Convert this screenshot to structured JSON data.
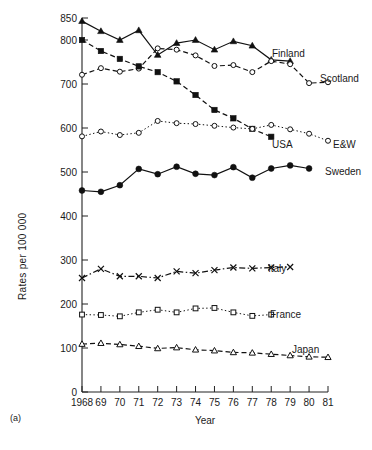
{
  "figure": {
    "panel_tag": "(a)",
    "background": "#ffffff",
    "ink_color": "#111111"
  },
  "chart_data": {
    "type": "line",
    "title": "",
    "subtitle": "",
    "xlabel": "Year",
    "ylabel": "Rates per 100 000",
    "xlim": [
      1968,
      1981
    ],
    "ylim": [
      0,
      850
    ],
    "grid": false,
    "legend_position": "inline-right-of-series",
    "x": [
      1968,
      1969,
      1970,
      1971,
      1972,
      1973,
      1974,
      1975,
      1976,
      1977,
      1978,
      1979,
      1980,
      1981
    ],
    "xtick_labels": [
      "1968",
      "69",
      "70",
      "71",
      "72",
      "73",
      "74",
      "75",
      "76",
      "77",
      "78",
      "79",
      "80",
      "81"
    ],
    "ytick_values": [
      0,
      100,
      200,
      300,
      400,
      500,
      600,
      700,
      800,
      850
    ],
    "ytick_labels": [
      "0",
      "100",
      "200",
      "300",
      "400",
      "500",
      "600",
      "700",
      "800",
      "850"
    ],
    "series": [
      {
        "name": "Finland",
        "label": "Finland",
        "marker": "filled-triangle",
        "linestyle": "solid",
        "x": [
          1968,
          1969,
          1970,
          1971,
          1972,
          1973,
          1974,
          1975,
          1976,
          1977,
          1978,
          1979
        ],
        "values": [
          843,
          820,
          800,
          822,
          766,
          793,
          800,
          778,
          797,
          787,
          755,
          752
        ]
      },
      {
        "name": "Scotland",
        "label": "Scotland",
        "marker": "open-circle",
        "linestyle": "dashed",
        "x": [
          1968,
          1969,
          1970,
          1971,
          1972,
          1973,
          1974,
          1975,
          1976,
          1977,
          1978,
          1979,
          1980,
          1981
        ],
        "values": [
          721,
          736,
          728,
          735,
          781,
          778,
          765,
          741,
          743,
          727,
          752,
          745,
          702,
          704
        ]
      },
      {
        "name": "USA",
        "label": "USA",
        "marker": "filled-square",
        "linestyle": "dashed",
        "x": [
          1968,
          1969,
          1970,
          1971,
          1972,
          1973,
          1974,
          1975,
          1976,
          1977,
          1978
        ],
        "values": [
          800,
          775,
          757,
          740,
          727,
          706,
          675,
          641,
          622,
          598,
          580
        ]
      },
      {
        "name": "E&W",
        "label": "E&W",
        "marker": "open-circle",
        "linestyle": "dotted",
        "x": [
          1968,
          1969,
          1970,
          1971,
          1972,
          1973,
          1974,
          1975,
          1976,
          1977,
          1978,
          1979,
          1980,
          1981
        ],
        "values": [
          581,
          592,
          584,
          589,
          616,
          611,
          609,
          605,
          601,
          598,
          607,
          597,
          587,
          571
        ]
      },
      {
        "name": "Sweden",
        "label": "Sweden",
        "marker": "filled-circle",
        "linestyle": "solid",
        "x": [
          1968,
          1969,
          1970,
          1971,
          1972,
          1973,
          1974,
          1975,
          1976,
          1977,
          1978,
          1979,
          1980
        ],
        "values": [
          458,
          455,
          470,
          507,
          495,
          512,
          496,
          493,
          511,
          487,
          508,
          515,
          508
        ]
      },
      {
        "name": "Italy",
        "label": "Italy",
        "marker": "x-cross",
        "linestyle": "dash-dot",
        "x": [
          1968,
          1969,
          1970,
          1971,
          1972,
          1973,
          1974,
          1975,
          1976,
          1977,
          1978,
          1979
        ],
        "values": [
          259,
          280,
          263,
          263,
          259,
          274,
          270,
          277,
          283,
          281,
          283,
          284
        ]
      },
      {
        "name": "France",
        "label": "France",
        "marker": "open-square",
        "linestyle": "dotted",
        "x": [
          1968,
          1969,
          1970,
          1971,
          1972,
          1973,
          1974,
          1975,
          1976,
          1977,
          1978
        ],
        "values": [
          176,
          175,
          172,
          181,
          187,
          181,
          190,
          191,
          181,
          173,
          176
        ]
      },
      {
        "name": "Japan",
        "label": "Japan",
        "marker": "open-triangle",
        "linestyle": "dashed",
        "x": [
          1968,
          1969,
          1970,
          1971,
          1972,
          1973,
          1974,
          1975,
          1976,
          1977,
          1978,
          1979,
          1980,
          1981
        ],
        "values": [
          109,
          111,
          108,
          104,
          99,
          101,
          96,
          94,
          90,
          89,
          86,
          83,
          80,
          79
        ]
      }
    ],
    "series_labels": [
      {
        "name": "Finland",
        "text": "Finland",
        "x": 272,
        "y": 57
      },
      {
        "name": "Scotland",
        "text": "Scotland",
        "x": 320,
        "y": 82
      },
      {
        "name": "USA",
        "text": "USA",
        "x": 272,
        "y": 148
      },
      {
        "name": "E&W",
        "text": "E&W",
        "x": 333,
        "y": 148
      },
      {
        "name": "Sweden",
        "text": "Sweden",
        "x": 325,
        "y": 175
      },
      {
        "name": "Italy",
        "text": "Italy",
        "x": 268,
        "y": 272
      },
      {
        "name": "France",
        "text": "France",
        "x": 270,
        "y": 318
      },
      {
        "name": "Japan",
        "text": "Japan",
        "x": 292,
        "y": 353
      }
    ]
  }
}
